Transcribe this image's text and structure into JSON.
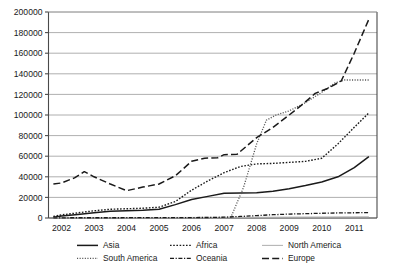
{
  "chart_data": {
    "type": "line",
    "title": "",
    "xlabel": "",
    "ylabel": "",
    "xlim": [
      2001.6,
      2011.7
    ],
    "ylim": [
      0,
      200000
    ],
    "grid": true,
    "legend_position": "bottom",
    "x_tick_labels": [
      "2002",
      "2003",
      "2004",
      "2005",
      "2006",
      "2007",
      "2008",
      "2009",
      "2010",
      "2011"
    ],
    "y_tick_labels": [
      "0",
      "20000",
      "40000",
      "60000",
      "80000",
      "100000",
      "120000",
      "140000",
      "160000",
      "180000",
      "200000"
    ],
    "y_tick_values": [
      0,
      20000,
      40000,
      60000,
      80000,
      100000,
      120000,
      140000,
      160000,
      180000,
      200000
    ],
    "series": [
      {
        "name": "Asia",
        "style": "solid",
        "color": "#1a1a1a",
        "x": [
          2001.75,
          2002,
          2002.5,
          2003,
          2003.5,
          2004,
          2004.5,
          2005,
          2005.5,
          2006,
          2006.5,
          2007,
          2007.5,
          2008,
          2008.5,
          2009,
          2009.5,
          2010,
          2010.5,
          2011,
          2011.45
        ],
        "values": [
          800,
          2000,
          3500,
          5000,
          6500,
          7000,
          7500,
          8500,
          13000,
          18000,
          21000,
          24000,
          24200,
          24500,
          26000,
          28500,
          31500,
          35000,
          40000,
          49000,
          59500
        ]
      },
      {
        "name": "Africa",
        "style": "dotted",
        "color": "#1a1a1a",
        "x": [
          2001.75,
          2002,
          2002.5,
          2003,
          2003.5,
          2004,
          2004.5,
          2005,
          2005.5,
          2006,
          2006.5,
          2007,
          2007.5,
          2008,
          2008.5,
          2009,
          2009.5,
          2010,
          2010.5,
          2011,
          2011.45
        ],
        "values": [
          1500,
          3000,
          5000,
          7000,
          8500,
          9000,
          9500,
          10500,
          16000,
          27000,
          36000,
          44000,
          50000,
          52500,
          53000,
          54000,
          55000,
          58000,
          72000,
          88000,
          102000
        ]
      },
      {
        "name": "North America",
        "style": "solid-light",
        "color": "#b5b5b5",
        "x": [
          2001.75,
          2005,
          2008,
          2011.45
        ],
        "values": [
          300,
          500,
          800,
          1200
        ]
      },
      {
        "name": "South America",
        "style": "fine-dotted",
        "color": "#555555",
        "x": [
          2007.2,
          2007.6,
          2008,
          2008.3,
          2008.6,
          2009,
          2009.5,
          2010,
          2010.4,
          2010.7,
          2011,
          2011.45
        ],
        "values": [
          0,
          30000,
          72000,
          95000,
          100000,
          104000,
          112000,
          122000,
          131000,
          134000,
          134000,
          134000
        ]
      },
      {
        "name": "Oceania",
        "style": "dash-dot",
        "color": "#1a1a1a",
        "x": [
          2001.75,
          2005,
          2006.5,
          2007,
          2007.5,
          2008,
          2008.5,
          2009,
          2009.5,
          2010,
          2010.5,
          2011,
          2011.45
        ],
        "values": [
          200,
          300,
          500,
          800,
          1500,
          2300,
          3200,
          3800,
          4200,
          4600,
          4900,
          5100,
          5300
        ]
      },
      {
        "name": "Europe",
        "style": "long-dash",
        "color": "#1a1a1a",
        "x": [
          2001.75,
          2002,
          2002.4,
          2002.7,
          2003,
          2003.5,
          2004,
          2004.5,
          2005,
          2005.5,
          2006,
          2006.4,
          2006.8,
          2007,
          2007.4,
          2008,
          2008.5,
          2009,
          2009.4,
          2009.8,
          2010.2,
          2010.6,
          2011,
          2011.45
        ],
        "values": [
          33000,
          34000,
          39000,
          45000,
          40000,
          33000,
          26500,
          30000,
          33000,
          41000,
          55000,
          58000,
          58500,
          61500,
          62000,
          78000,
          88000,
          100000,
          110000,
          121000,
          126000,
          133000,
          160000,
          193000
        ]
      }
    ]
  },
  "legend": {
    "items": [
      {
        "label": "Asia",
        "style": "solid"
      },
      {
        "label": "Africa",
        "style": "dotted"
      },
      {
        "label": "North America",
        "style": "solid-light"
      },
      {
        "label": "South America",
        "style": "fine-dotted"
      },
      {
        "label": "Oceania",
        "style": "dash-dot"
      },
      {
        "label": "Europe",
        "style": "long-dash"
      }
    ]
  }
}
